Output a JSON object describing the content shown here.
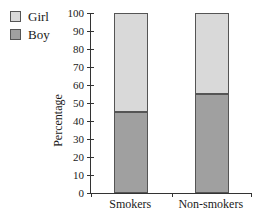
{
  "chart_data": {
    "type": "bar",
    "subtype": "stacked",
    "title": "",
    "xlabel": "",
    "ylabel": "Percentage",
    "ylim": [
      0,
      100
    ],
    "ytick_step": 10,
    "grid": false,
    "legend_position": "top-left",
    "categories": [
      "Smokers",
      "Non-smokers"
    ],
    "series": [
      {
        "name": "Boy",
        "color": "#a0a0a0",
        "values": [
          45,
          55
        ]
      },
      {
        "name": "Girl",
        "color": "#d9d9d9",
        "values": [
          55,
          45
        ]
      }
    ],
    "legend_order": [
      "Girl",
      "Boy"
    ],
    "axis_color": "#333333",
    "bar_border_color": "#555555"
  }
}
